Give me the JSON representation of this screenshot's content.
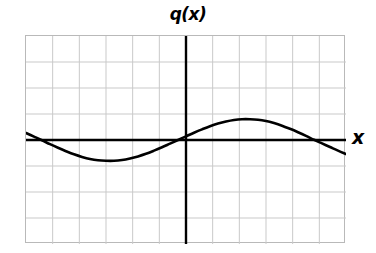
{
  "chart_data": {
    "type": "line",
    "title": "q(x)",
    "xlabel": "x",
    "ylabel": "",
    "grid": true,
    "legend_position": "none",
    "axis_label_x": "x",
    "function_label": "q(x)",
    "xlim": [
      -6,
      6
    ],
    "ylim": [
      -4,
      4
    ],
    "x_major_step": 1,
    "y_major_step": 1,
    "x_gridline_count": 12,
    "y_gridline_count": 8,
    "x_tick_labels": [],
    "y_tick_labels": [],
    "series": [
      {
        "name": "q(x)",
        "color": "#000000",
        "x": [
          -6.0,
          -5.7,
          -5.4,
          -5.1,
          -4.8,
          -4.5,
          -4.2,
          -3.9,
          -3.6,
          -3.3,
          -3.0,
          -2.7,
          -2.4,
          -2.1,
          -1.8,
          -1.5,
          -1.2,
          -0.9,
          -0.6,
          -0.3,
          0.0,
          0.3,
          0.6,
          0.9,
          1.2,
          1.5,
          1.8,
          2.1,
          2.4,
          2.7,
          3.0,
          3.3,
          3.6,
          3.9,
          4.2,
          4.5,
          4.8,
          5.1,
          5.4,
          5.7,
          6.0
        ],
        "y": [
          0.27,
          0.13,
          -0.01,
          -0.16,
          -0.3,
          -0.43,
          -0.55,
          -0.65,
          -0.73,
          -0.78,
          -0.8,
          -0.8,
          -0.77,
          -0.71,
          -0.63,
          -0.53,
          -0.41,
          -0.28,
          -0.14,
          0.0,
          0.14,
          0.28,
          0.41,
          0.53,
          0.63,
          0.71,
          0.77,
          0.8,
          0.8,
          0.78,
          0.73,
          0.65,
          0.55,
          0.43,
          0.3,
          0.16,
          0.01,
          -0.13,
          -0.27,
          -0.41,
          -0.54
        ]
      }
    ],
    "annotations": {
      "zero_crossings": [
        -5.45,
        0.0,
        5.42
      ],
      "minimum": {
        "x": -2.85,
        "y": -0.8
      },
      "maximum": {
        "x": 3.0,
        "y": 0.8
      },
      "amplitude": 0.8
    },
    "colors": {
      "curve": "#000000",
      "axis": "#000000",
      "grid_major": "#c4c4c4",
      "grid_minor": "#dcdcdc",
      "frame": "#b9b9b9",
      "background": "#ffffff"
    }
  }
}
